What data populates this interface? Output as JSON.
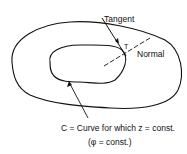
{
  "diagram": {
    "labels": {
      "tangent": "Tangent",
      "normal": "Normal",
      "tangent_vector": "T",
      "caption_line1": "C = Curve for which z = const.",
      "caption_line2": "(φ = const.)"
    },
    "elements": [
      "outer closed curve",
      "inner closed curve C",
      "tangent line at point on C",
      "dashed normal line",
      "arrow pointing to curve C"
    ],
    "colors": {
      "stroke": "#111111",
      "background": "#ffffff"
    }
  }
}
